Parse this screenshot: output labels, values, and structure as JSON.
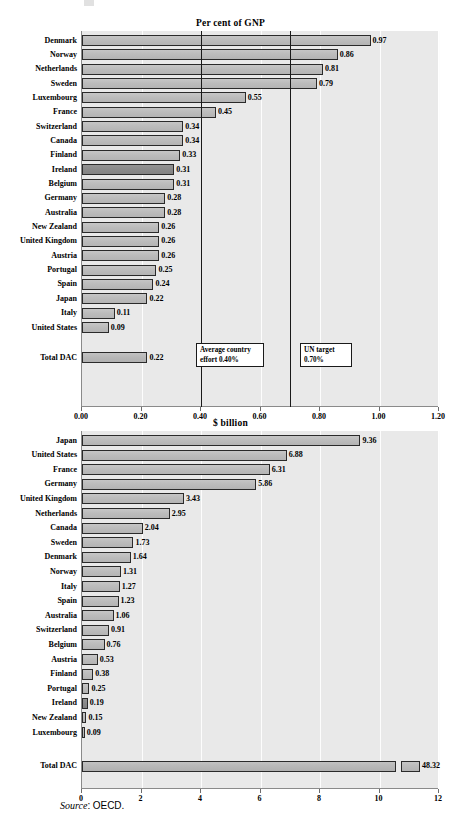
{
  "source_note": {
    "label": "Source",
    "separator": ":",
    "value": "OECD."
  },
  "chart_data": [
    {
      "type": "bar",
      "orientation": "horizontal",
      "title": "Per cent of GNP",
      "xlabel": "",
      "ylabel": "",
      "xlim": [
        0,
        1.2
      ],
      "xticks": [
        "0.00",
        "0.20",
        "0.40",
        "0.60",
        "0.80",
        "1.00",
        "1.20"
      ],
      "grid": true,
      "legend": "none",
      "categories": [
        "Denmark",
        "Norway",
        "Netherlands",
        "Sweden",
        "Luxembourg",
        "France",
        "Switzerland",
        "Canada",
        "Finland",
        "Ireland",
        "Belgium",
        "Germany",
        "Australia",
        "New Zealand",
        "United Kingdom",
        "Austria",
        "Portugal",
        "Spain",
        "Japan",
        "Italy",
        "United States"
      ],
      "values": [
        0.97,
        0.86,
        0.81,
        0.79,
        0.55,
        0.45,
        0.34,
        0.34,
        0.33,
        0.31,
        0.31,
        0.28,
        0.28,
        0.26,
        0.26,
        0.26,
        0.25,
        0.24,
        0.22,
        0.11,
        0.09
      ],
      "labels": [
        "0.97",
        "0.86",
        "0.81",
        "0.79",
        "0.55",
        "0.45",
        "0.34",
        "0.34",
        "0.33",
        "0.31",
        "0.31",
        "0.28",
        "0.28",
        "0.26",
        "0.26",
        "0.26",
        "0.25",
        "0.24",
        "0.22",
        "0.11",
        "0.09"
      ],
      "highlighted": [
        "Ireland"
      ],
      "total": {
        "category": "Total DAC",
        "value": 0.22,
        "label": "0.22"
      },
      "reference_lines": [
        {
          "value": 0.4,
          "annotation": "Average country effort 0.40%"
        },
        {
          "value": 0.7,
          "annotation": "UN target 0.70%"
        }
      ],
      "annotations": [
        {
          "line1": "Average country",
          "line2": "effort 0.40%"
        },
        {
          "line1": "UN target",
          "line2": "0.70%"
        }
      ]
    },
    {
      "type": "bar",
      "orientation": "horizontal",
      "title": "$ billion",
      "xlabel": "",
      "ylabel": "",
      "xlim": [
        0,
        12
      ],
      "xticks": [
        "0",
        "2",
        "4",
        "6",
        "8",
        "10",
        "12"
      ],
      "grid": true,
      "legend": "none",
      "categories": [
        "Japan",
        "United States",
        "France",
        "Germany",
        "United Kingdom",
        "Netherlands",
        "Canada",
        "Sweden",
        "Denmark",
        "Norway",
        "Italy",
        "Spain",
        "Australia",
        "Switzerland",
        "Belgium",
        "Austria",
        "Finland",
        "Portugal",
        "Ireland",
        "New Zealand",
        "Luxembourg"
      ],
      "values": [
        9.36,
        6.88,
        6.31,
        5.86,
        3.43,
        2.95,
        2.04,
        1.73,
        1.64,
        1.31,
        1.27,
        1.23,
        1.06,
        0.91,
        0.76,
        0.53,
        0.38,
        0.25,
        0.19,
        0.15,
        0.09
      ],
      "labels": [
        "9.36",
        "6.88",
        "6.31",
        "5.86",
        "3.43",
        "2.95",
        "2.04",
        "1.73",
        "1.64",
        "1.31",
        "1.27",
        "1.23",
        "1.06",
        "0.91",
        "0.76",
        "0.53",
        "0.38",
        "0.25",
        "0.19",
        "0.15",
        "0.09"
      ],
      "highlighted": [
        "Ireland"
      ],
      "total": {
        "category": "Total DAC",
        "value": 48.32,
        "label": "48.32",
        "axis_broken": true
      }
    }
  ]
}
